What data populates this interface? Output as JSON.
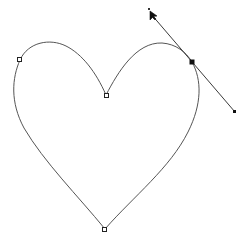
{
  "canvas": {
    "description": "Vector path editing canvas showing a heart-shaped bezier path",
    "colors": {
      "background": "#ffffff",
      "path_stroke": "#555555",
      "handle_stroke": "#3a3a3a",
      "anchor_fill": "#111111"
    },
    "path": {
      "name": "heart-path",
      "closed": true,
      "anchor_points": [
        {
          "id": "left-anchor",
          "state": "unselected"
        },
        {
          "id": "top-cusp-anchor",
          "state": "unselected"
        },
        {
          "id": "right-anchor",
          "state": "selected"
        },
        {
          "id": "bottom-tip-anchor",
          "state": "unselected"
        }
      ]
    },
    "direction_handle": {
      "attached_to": "right-anchor",
      "visible": true
    },
    "cursor": {
      "tool": "direct-selection-arrow",
      "state": "dragging-handle"
    }
  }
}
